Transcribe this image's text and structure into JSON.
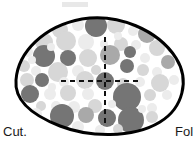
{
  "figure": {
    "name": "oocyte-cross-section-diagram",
    "type": "schematic-diagram",
    "canvas": {
      "width": 195,
      "height": 156,
      "background": "#ffffff"
    },
    "outline": {
      "name": "oocyte-outline",
      "description": "closed asymmetric ovoid, pointed at left, rounded at right",
      "stroke_color": "#000000",
      "stroke_width": 3,
      "fill_color": "#ffffff",
      "bounds": {
        "left": 16,
        "top": 18,
        "right": 183,
        "bottom": 134
      }
    },
    "axes": {
      "name": "crosshair-axes",
      "stroke_color": "#111111",
      "stroke_width": 2,
      "dash_pattern": "5,4",
      "center": {
        "x": 105,
        "y": 81
      },
      "vertical": {
        "x": 105,
        "y1": 37,
        "y2": 123
      },
      "horizontal": {
        "y": 81,
        "x1": 61,
        "x2": 141
      }
    },
    "labels": {
      "left": {
        "text": "Cut.",
        "x": 3,
        "y": 136
      },
      "right": {
        "text": "Fol",
        "x": 175,
        "y": 136
      }
    },
    "palette": {
      "dark": "#757575",
      "medium": "#a9a9a9",
      "light": "#d7d7d7",
      "pale": "#ececec",
      "outline": "#000000",
      "background": "#ffffff",
      "text": "#1a1a1a"
    },
    "top_smudge": {
      "name": "faint-gray-smudge",
      "x": 62,
      "y": 2,
      "width": 26,
      "height": 5,
      "color": "#e8e8e8"
    },
    "circles": [
      {
        "cx": 60,
        "cy": 30,
        "r": 8,
        "tone": "light"
      },
      {
        "cx": 78,
        "cy": 25,
        "r": 6,
        "tone": "pale"
      },
      {
        "cx": 96,
        "cy": 26,
        "r": 11,
        "tone": "dark"
      },
      {
        "cx": 116,
        "cy": 25,
        "r": 9,
        "tone": "light"
      },
      {
        "cx": 133,
        "cy": 31,
        "r": 5,
        "tone": "pale"
      },
      {
        "cx": 147,
        "cy": 34,
        "r": 9,
        "tone": "medium"
      },
      {
        "cx": 44,
        "cy": 42,
        "r": 9,
        "tone": "light"
      },
      {
        "cx": 66,
        "cy": 41,
        "r": 10,
        "tone": "light"
      },
      {
        "cx": 86,
        "cy": 42,
        "r": 8,
        "tone": "pale"
      },
      {
        "cx": 104,
        "cy": 44,
        "r": 4,
        "tone": "pale"
      },
      {
        "cx": 121,
        "cy": 44,
        "r": 7,
        "tone": "light"
      },
      {
        "cx": 136,
        "cy": 45,
        "r": 5,
        "tone": "pale"
      },
      {
        "cx": 157,
        "cy": 48,
        "r": 8,
        "tone": "light"
      },
      {
        "cx": 172,
        "cy": 48,
        "r": 5,
        "tone": "light"
      },
      {
        "cx": 28,
        "cy": 52,
        "r": 5,
        "tone": "pale"
      },
      {
        "cx": 44,
        "cy": 56,
        "r": 11,
        "tone": "dark"
      },
      {
        "cx": 68,
        "cy": 58,
        "r": 8,
        "tone": "dark"
      },
      {
        "cx": 88,
        "cy": 58,
        "r": 9,
        "tone": "light"
      },
      {
        "cx": 110,
        "cy": 55,
        "r": 10,
        "tone": "medium"
      },
      {
        "cx": 130,
        "cy": 52,
        "r": 6,
        "tone": "dark"
      },
      {
        "cx": 145,
        "cy": 58,
        "r": 5,
        "tone": "pale"
      },
      {
        "cx": 168,
        "cy": 62,
        "r": 7,
        "tone": "medium"
      },
      {
        "cx": 24,
        "cy": 66,
        "r": 6,
        "tone": "light"
      },
      {
        "cx": 36,
        "cy": 71,
        "r": 5,
        "tone": "pale"
      },
      {
        "cx": 58,
        "cy": 72,
        "r": 10,
        "tone": "light"
      },
      {
        "cx": 78,
        "cy": 71,
        "r": 6,
        "tone": "pale"
      },
      {
        "cx": 96,
        "cy": 70,
        "r": 5,
        "tone": "light"
      },
      {
        "cx": 127,
        "cy": 66,
        "r": 7,
        "tone": "dark"
      },
      {
        "cx": 143,
        "cy": 70,
        "r": 6,
        "tone": "light"
      },
      {
        "cx": 157,
        "cy": 72,
        "r": 5,
        "tone": "pale"
      },
      {
        "cx": 27,
        "cy": 80,
        "r": 7,
        "tone": "light"
      },
      {
        "cx": 42,
        "cy": 80,
        "r": 7,
        "tone": "dark"
      },
      {
        "cx": 64,
        "cy": 82,
        "r": 5,
        "tone": "pale"
      },
      {
        "cx": 85,
        "cy": 80,
        "r": 9,
        "tone": "light"
      },
      {
        "cx": 105,
        "cy": 81,
        "r": 9,
        "tone": "dark"
      },
      {
        "cx": 123,
        "cy": 84,
        "r": 6,
        "tone": "light"
      },
      {
        "cx": 140,
        "cy": 82,
        "r": 5,
        "tone": "pale"
      },
      {
        "cx": 160,
        "cy": 83,
        "r": 9,
        "tone": "light"
      },
      {
        "cx": 174,
        "cy": 80,
        "r": 5,
        "tone": "pale"
      },
      {
        "cx": 30,
        "cy": 94,
        "r": 9,
        "tone": "dark"
      },
      {
        "cx": 50,
        "cy": 94,
        "r": 6,
        "tone": "pale"
      },
      {
        "cx": 68,
        "cy": 93,
        "r": 8,
        "tone": "light"
      },
      {
        "cx": 88,
        "cy": 94,
        "r": 6,
        "tone": "pale"
      },
      {
        "cx": 127,
        "cy": 97,
        "r": 14,
        "tone": "dark"
      },
      {
        "cx": 150,
        "cy": 95,
        "r": 6,
        "tone": "light"
      },
      {
        "cx": 167,
        "cy": 95,
        "r": 5,
        "tone": "pale"
      },
      {
        "cx": 41,
        "cy": 106,
        "r": 5,
        "tone": "light"
      },
      {
        "cx": 56,
        "cy": 106,
        "r": 5,
        "tone": "pale"
      },
      {
        "cx": 74,
        "cy": 107,
        "r": 6,
        "tone": "pale"
      },
      {
        "cx": 95,
        "cy": 106,
        "r": 7,
        "tone": "light"
      },
      {
        "cx": 152,
        "cy": 108,
        "r": 5,
        "tone": "pale"
      },
      {
        "cx": 36,
        "cy": 114,
        "r": 6,
        "tone": "pale"
      },
      {
        "cx": 62,
        "cy": 116,
        "r": 12,
        "tone": "dark"
      },
      {
        "cx": 86,
        "cy": 115,
        "r": 8,
        "tone": "medium"
      },
      {
        "cx": 107,
        "cy": 118,
        "r": 9,
        "tone": "dark"
      },
      {
        "cx": 131,
        "cy": 120,
        "r": 13,
        "tone": "dark"
      },
      {
        "cx": 152,
        "cy": 117,
        "r": 6,
        "tone": "light"
      },
      {
        "cx": 78,
        "cy": 127,
        "r": 6,
        "tone": "pale"
      },
      {
        "cx": 100,
        "cy": 130,
        "r": 5,
        "tone": "pale"
      },
      {
        "cx": 118,
        "cy": 129,
        "r": 5,
        "tone": "light"
      },
      {
        "cx": 51,
        "cy": 47,
        "r": 4,
        "tone": "pale"
      },
      {
        "cx": 118,
        "cy": 36,
        "r": 4,
        "tone": "pale"
      },
      {
        "cx": 32,
        "cy": 60,
        "r": 4,
        "tone": "pale"
      },
      {
        "cx": 52,
        "cy": 87,
        "r": 4,
        "tone": "pale"
      },
      {
        "cx": 142,
        "cy": 109,
        "r": 4,
        "tone": "pale"
      },
      {
        "cx": 112,
        "cy": 104,
        "r": 4,
        "tone": "pale"
      }
    ]
  }
}
